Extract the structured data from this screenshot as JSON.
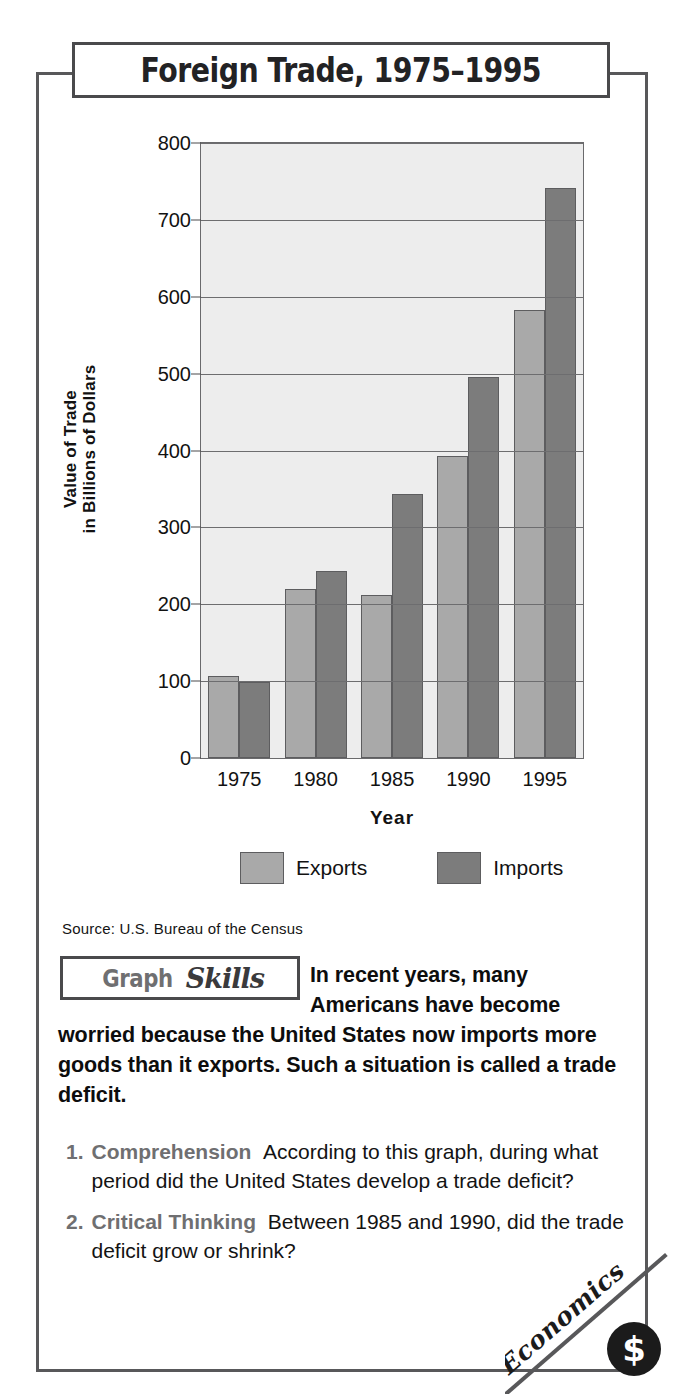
{
  "title": "Foreign Trade, 1975–1995",
  "source": "Source:  U.S. Bureau of the Census",
  "skills_badge": {
    "word1": "Graph",
    "word2": "Skills"
  },
  "intro_text": "In recent years, many Americans have become worried because the United States now imports more goods than it exports. Such a situation is called a trade deficit.",
  "questions": [
    {
      "number": "1.",
      "category": "Comprehension",
      "text": "According to this graph, during what period did the United States develop a trade deficit?"
    },
    {
      "number": "2.",
      "category": "Critical Thinking",
      "text": "Between 1985 and 1990, did the trade deficit grow or shrink?"
    }
  ],
  "corner_badge": {
    "label": "Economics",
    "icon": "dollar-sign"
  },
  "colors": {
    "exports": "#a9a9a9",
    "imports": "#7c7c7c",
    "frame": "#58585a",
    "panel_bg": "#ececec",
    "plot_bg": "#ededed",
    "accent_gray": "#6f6f71"
  },
  "chart_data": {
    "type": "bar",
    "title": "Foreign Trade, 1975–1995",
    "xlabel": "Year",
    "ylabel": "Value of Trade in Billions of Dollars",
    "ylabel_line1": "Value of Trade",
    "ylabel_line2": "in Billions of Dollars",
    "categories": [
      "1975",
      "1980",
      "1985",
      "1990",
      "1995"
    ],
    "yticks": [
      0,
      100,
      200,
      300,
      400,
      500,
      600,
      700,
      800
    ],
    "ylim": [
      0,
      800
    ],
    "grid": true,
    "legend_position": "bottom",
    "series": [
      {
        "name": "Exports",
        "color": "#a9a9a9",
        "values": [
          107,
          220,
          212,
          393,
          583
        ]
      },
      {
        "name": "Imports",
        "color": "#7c7c7c",
        "values": [
          99,
          243,
          343,
          495,
          742
        ]
      }
    ]
  }
}
